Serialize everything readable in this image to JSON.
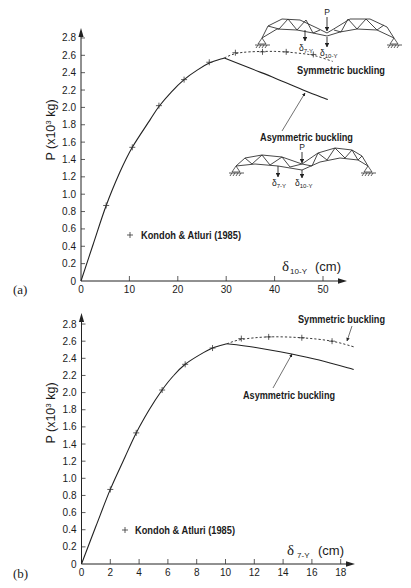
{
  "figure": {
    "panels": [
      {
        "label": "(a)",
        "ylabel": {
          "prefix": "P (x10",
          "sup": "3",
          "suffix": " kg)"
        },
        "xlabel": {
          "symbol": "δ",
          "sub": "10-Y",
          "unit": "(cm)"
        },
        "legend": {
          "marker": "+",
          "label": "Kondoh & Atluri (1985)"
        },
        "annotations": {
          "symmetric": "Symmetric buckling",
          "asymmetric": "Asymmetric buckling"
        },
        "diagrams": {
          "symmetric": {
            "load": "P",
            "deflections": [
              {
                "symbol": "δ",
                "sub": "7-Y"
              },
              {
                "symbol": "δ",
                "sub": "10-Y"
              }
            ]
          },
          "asymmetric": {
            "load": "P",
            "deflections": [
              {
                "symbol": "δ",
                "sub": "7-Y"
              },
              {
                "symbol": "δ",
                "sub": "10-Y"
              }
            ]
          }
        }
      },
      {
        "label": "(b)",
        "ylabel": {
          "prefix": "P (x10",
          "sup": "3",
          "suffix": " kg)"
        },
        "xlabel": {
          "symbol": "δ",
          "sub": "7-Y",
          "unit": "(cm)"
        },
        "legend": {
          "marker": "+",
          "label": "Kondoh & Atluri (1985)"
        },
        "annotations": {
          "symmetric": "Symmetric buckling",
          "asymmetric": "Asymmetric buckling"
        }
      }
    ]
  },
  "chart_data": [
    {
      "type": "line",
      "panel": "(a)",
      "title": "",
      "xlabel": "δ10-Y (cm)",
      "ylabel": "P (x10³ kg)",
      "xlim": [
        0,
        55
      ],
      "ylim": [
        0,
        2.8
      ],
      "grid": false,
      "legend_position": "lower center",
      "x_ticks": [
        0,
        10,
        20,
        30,
        40,
        50
      ],
      "x_tick_labels": [
        "0",
        "10",
        "20",
        "30",
        "40",
        "50"
      ],
      "y_ticks": [
        0,
        0.2,
        0.4,
        0.6,
        0.8,
        1.0,
        1.2,
        1.4,
        1.6,
        1.8,
        2.0,
        2.2,
        2.4,
        2.6,
        2.8
      ],
      "y_tick_labels": [
        "0",
        "0.2",
        "0.4",
        "0.6",
        "0.8",
        "1.0",
        "1.2",
        "1.4",
        "1.6",
        "1.8",
        "2.0",
        "2.2",
        "2.4",
        "2.6",
        "2.8"
      ],
      "series": [
        {
          "id": "primary_path",
          "name": "",
          "style": "solid",
          "points": [
            [
              0,
              0
            ],
            [
              2.5,
              0.42
            ],
            [
              5.2,
              0.87
            ],
            [
              8,
              1.25
            ],
            [
              10.6,
              1.54
            ],
            [
              14.3,
              1.86
            ],
            [
              16.1,
              2.01
            ],
            [
              18.7,
              2.18
            ],
            [
              21.3,
              2.32
            ],
            [
              24,
              2.43
            ],
            [
              26.5,
              2.51
            ],
            [
              29.6,
              2.57
            ]
          ]
        },
        {
          "id": "asymmetric",
          "name": "Asymmetric buckling",
          "style": "solid",
          "points": [
            [
              29.6,
              2.57
            ],
            [
              35,
              2.45
            ],
            [
              40,
              2.34
            ],
            [
              46.4,
              2.19
            ],
            [
              51,
              2.09
            ]
          ]
        },
        {
          "id": "symmetric",
          "name": "Symmetric buckling",
          "style": "dashed",
          "points": [
            [
              29.6,
              2.57
            ],
            [
              31.9,
              2.62
            ],
            [
              35,
              2.64
            ],
            [
              40,
              2.645
            ],
            [
              44,
              2.63
            ],
            [
              48,
              2.6
            ],
            [
              52,
              2.53
            ]
          ]
        },
        {
          "id": "reference",
          "name": "Kondoh & Atluri (1985)",
          "style": "marker",
          "marker": "+",
          "points": [
            [
              5.2,
              0.87
            ],
            [
              10.6,
              1.54
            ],
            [
              16.1,
              2.02
            ],
            [
              21.3,
              2.32
            ],
            [
              26.5,
              2.52
            ],
            [
              31.9,
              2.63
            ],
            [
              37.5,
              2.64
            ],
            [
              42.4,
              2.64
            ],
            [
              48,
              2.61
            ]
          ]
        }
      ],
      "annotations": [
        "Symmetric buckling",
        "Asymmetric buckling"
      ]
    },
    {
      "type": "line",
      "panel": "(b)",
      "title": "",
      "xlabel": "δ7-Y (cm)",
      "ylabel": "P (x10³ kg)",
      "xlim": [
        0,
        19.5
      ],
      "ylim": [
        0,
        2.8
      ],
      "grid": false,
      "legend_position": "lower center",
      "x_ticks": [
        0,
        2,
        4,
        6,
        8,
        10,
        12,
        14,
        16,
        18
      ],
      "x_tick_labels": [
        "0",
        "2",
        "4",
        "6",
        "8",
        "10",
        "12",
        "14",
        "16",
        "18"
      ],
      "y_ticks": [
        0,
        0.2,
        0.4,
        0.6,
        0.8,
        1.0,
        1.2,
        1.4,
        1.6,
        1.8,
        2.0,
        2.2,
        2.4,
        2.6,
        2.8
      ],
      "y_tick_labels": [
        "0",
        "0.2",
        "0.4",
        "0.6",
        "0.8",
        "1.0",
        "1.2",
        "1.4",
        "1.6",
        "1.8",
        "2.0",
        "2.2",
        "2.4",
        "2.6",
        "2.8"
      ],
      "series": [
        {
          "id": "primary_path",
          "name": "",
          "style": "solid",
          "points": [
            [
              0,
              0
            ],
            [
              1,
              0.44
            ],
            [
              2,
              0.87
            ],
            [
              3,
              1.24
            ],
            [
              3.8,
              1.53
            ],
            [
              4.7,
              1.8
            ],
            [
              5.6,
              2.03
            ],
            [
              6.4,
              2.2
            ],
            [
              7.2,
              2.33
            ],
            [
              8.2,
              2.44
            ],
            [
              9.1,
              2.52
            ],
            [
              10.1,
              2.57
            ]
          ]
        },
        {
          "id": "asymmetric",
          "name": "Asymmetric buckling",
          "style": "solid",
          "points": [
            [
              10.1,
              2.57
            ],
            [
              12,
              2.53
            ],
            [
              14.6,
              2.45
            ],
            [
              16.5,
              2.38
            ],
            [
              18.9,
              2.27
            ]
          ]
        },
        {
          "id": "symmetric",
          "name": "Symmetric buckling",
          "style": "dashed",
          "points": [
            [
              10.1,
              2.57
            ],
            [
              11.1,
              2.62
            ],
            [
              13,
              2.65
            ],
            [
              15.3,
              2.64
            ],
            [
              17.4,
              2.6
            ],
            [
              19,
              2.53
            ]
          ]
        },
        {
          "id": "reference",
          "name": "Kondoh & Atluri (1985)",
          "style": "marker",
          "marker": "+",
          "points": [
            [
              2,
              0.87
            ],
            [
              3.8,
              1.53
            ],
            [
              5.6,
              2.03
            ],
            [
              7.2,
              2.33
            ],
            [
              9.1,
              2.52
            ],
            [
              11.1,
              2.63
            ],
            [
              13,
              2.65
            ],
            [
              15.3,
              2.64
            ],
            [
              17.4,
              2.6
            ]
          ]
        }
      ],
      "annotations": [
        "Symmetric buckling",
        "Asymmetric buckling"
      ]
    }
  ]
}
